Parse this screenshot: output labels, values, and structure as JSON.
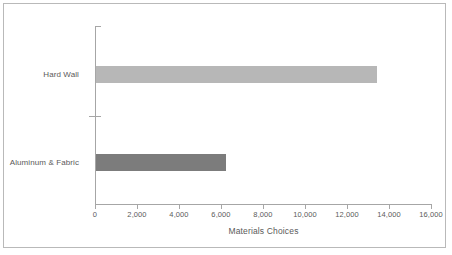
{
  "chart_data": {
    "type": "bar",
    "orientation": "horizontal",
    "title": "",
    "xlabel": "Materials Choices",
    "ylabel": "",
    "categories": [
      "Hard Wall",
      "Aluminum & Fabric"
    ],
    "values": [
      13400,
      6200
    ],
    "series": [
      {
        "name": "Materials Choices",
        "values": [
          13400,
          6200
        ],
        "colors": [
          "#b7b7b7",
          "#7c7c7c"
        ]
      }
    ],
    "xlim": [
      0,
      16000
    ],
    "xticks": [
      0,
      2000,
      4000,
      6000,
      8000,
      10000,
      12000,
      14000,
      16000
    ],
    "xticklabels": [
      "0",
      "2,000",
      "4,000",
      "6,000",
      "8,000",
      "10,000",
      "12,000",
      "14,000",
      "16,000"
    ],
    "grid": false,
    "legend": false,
    "legend_position": "none",
    "bar_colors": {
      "hard_wall": "#b7b7b7",
      "aluminum_fabric": "#7c7c7c"
    },
    "axis_color": "#a6a6a6",
    "text_color": "#5a5a5a",
    "frame_color": "#b9b9b9",
    "background": "#ffffff"
  }
}
